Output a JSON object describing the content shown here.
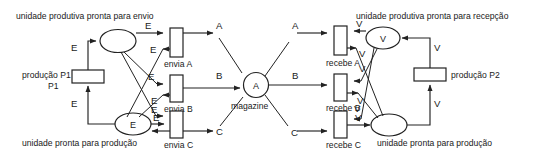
{
  "diagram": {
    "type": "petri-net",
    "title": "",
    "colors": {
      "stroke": "#222222",
      "background": "#ffffff",
      "text": "#1a1a1a"
    },
    "places": [
      {
        "id": "p-envio",
        "label": "unidade produtiva pronta para envio",
        "token": "",
        "side": "left",
        "label_position": "top-left"
      },
      {
        "id": "p-prod-esq",
        "label": "unidade pronta para produção",
        "token": "E",
        "side": "left",
        "label_position": "bottom"
      },
      {
        "id": "p-magazine",
        "label": "magazine",
        "token": "A",
        "side": "center",
        "label_position": "bottom"
      },
      {
        "id": "p-recepcao",
        "label": "unidade produtiva pronta para recepção",
        "token": "V",
        "side": "right",
        "label_position": "top"
      },
      {
        "id": "p-prod-dir",
        "label": "unidade pronta para produção",
        "token": "",
        "side": "right",
        "label_position": "bottom"
      }
    ],
    "transitions": [
      {
        "id": "t-p1",
        "label": "produção P1",
        "label_position": "left"
      },
      {
        "id": "t-envia-a",
        "label": "envia A",
        "label_position": "bottom"
      },
      {
        "id": "t-envia-b",
        "label": "envia B",
        "label_position": "bottom"
      },
      {
        "id": "t-envia-c",
        "label": "envia C",
        "label_position": "bottom"
      },
      {
        "id": "t-recebe-a",
        "label": "recebe A",
        "label_position": "bottom"
      },
      {
        "id": "t-recebe-b",
        "label": "recebe B",
        "label_position": "bottom"
      },
      {
        "id": "t-recebe-c",
        "label": "recebe C",
        "label_position": "bottom"
      },
      {
        "id": "t-p2",
        "label": "produção P2",
        "label_position": "right"
      }
    ],
    "arc_labels": {
      "left_e1": "E",
      "left_e2": "E",
      "left_e3": "E",
      "left_e4": "E",
      "left_e5": "E",
      "left_e6": "E",
      "left_e7": "E",
      "left_e8": "E",
      "left_e9": "E",
      "channel_a_left": "A",
      "channel_b_left": "B",
      "channel_c_left": "C",
      "channel_a_right": "A",
      "channel_b_right": "B",
      "channel_c_right": "C",
      "right_v1": "V",
      "right_v2": "V",
      "right_v3": "V",
      "right_v4": "V",
      "right_v5": "V",
      "right_v6": "V",
      "right_v7": "V",
      "right_v8": "V",
      "right_v9": "V"
    }
  }
}
